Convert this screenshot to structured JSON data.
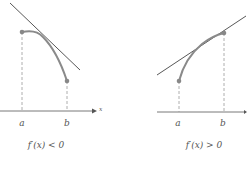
{
  "panels": [
    {
      "caption": "f′(x) < 0",
      "a_label": "a",
      "b_label": "b",
      "axis_label": "x"
    },
    {
      "caption": "f′(x) > 0",
      "a_label": "a",
      "b_label": "b"
    }
  ],
  "colors": {
    "curve": "#8a8a8a",
    "line": "#444444",
    "dash": "#999999",
    "point": "#888888"
  }
}
